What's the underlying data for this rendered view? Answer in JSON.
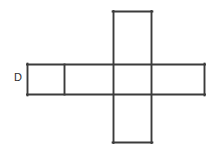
{
  "figure": {
    "background_color": "#ffffff",
    "line_color": "#3b3b3b",
    "line_width": 1.9,
    "canvas": {
      "width": 213,
      "height": 151
    }
  },
  "labels": {
    "d": "D"
  },
  "geometry": {
    "horizontal_bar": {
      "x1": 27,
      "y1": 64.5,
      "x2": 205,
      "y2": 94.5
    },
    "vertical_bar": {
      "x1": 113,
      "y1": 11,
      "x2": 151.5,
      "y2": 143
    },
    "left_divider_x": 64.5,
    "segments": [
      {
        "name": "horizontal-top-edge",
        "x1": 27,
        "y1": 64.5,
        "x2": 205,
        "y2": 64.5
      },
      {
        "name": "horizontal-bottom-edge",
        "x1": 27,
        "y1": 94.5,
        "x2": 205,
        "y2": 94.5
      },
      {
        "name": "horizontal-left-edge",
        "x1": 27,
        "y1": 64.5,
        "x2": 27,
        "y2": 94.5
      },
      {
        "name": "horizontal-right-edge",
        "x1": 205,
        "y1": 64.5,
        "x2": 205,
        "y2": 94.5
      },
      {
        "name": "left-cell-divider",
        "x1": 64.5,
        "y1": 64.5,
        "x2": 64.5,
        "y2": 94.5
      },
      {
        "name": "vertical-left-edge",
        "x1": 113,
        "y1": 11,
        "x2": 113,
        "y2": 143
      },
      {
        "name": "vertical-right-edge",
        "x1": 151.5,
        "y1": 11,
        "x2": 151.5,
        "y2": 143
      },
      {
        "name": "vertical-top-edge",
        "x1": 113,
        "y1": 11,
        "x2": 151.5,
        "y2": 11
      },
      {
        "name": "vertical-bottom-edge",
        "x1": 113,
        "y1": 143,
        "x2": 151.5,
        "y2": 143
      }
    ]
  }
}
